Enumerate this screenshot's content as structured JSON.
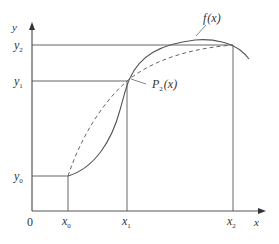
{
  "diagram": {
    "title": "",
    "axes": {
      "origin_label": "0",
      "x_label": "x",
      "y_label": "y"
    },
    "x_ticks": [
      {
        "main": "x",
        "sub": "0"
      },
      {
        "main": "x",
        "sub": "1"
      },
      {
        "main": "x",
        "sub": "2"
      }
    ],
    "y_ticks": [
      {
        "main": "y",
        "sub": "0"
      },
      {
        "main": "y",
        "sub": "1"
      },
      {
        "main": "y",
        "sub": "2"
      }
    ],
    "curves": {
      "f": {
        "label_main": "f",
        "label_args": "(x)",
        "style": "solid"
      },
      "p2": {
        "label_main": "P",
        "label_sub": "2",
        "label_args": "(x)",
        "style": "dashed"
      }
    },
    "colors": {
      "line": "#555555",
      "text": "#333333",
      "background": "#ffffff"
    }
  }
}
